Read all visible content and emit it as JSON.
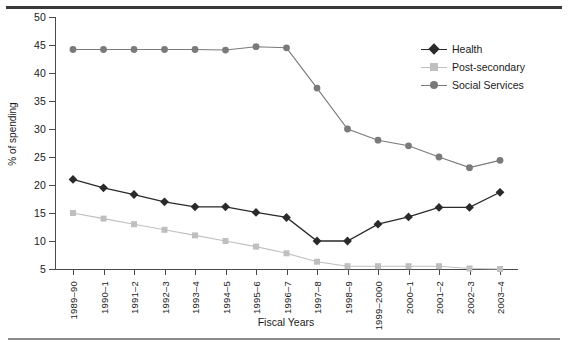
{
  "chart_data": {
    "type": "line",
    "title": "",
    "xlabel": "Fiscal Years",
    "ylabel": "% of spending",
    "ylim": [
      5,
      50
    ],
    "yticks": [
      5,
      10,
      15,
      20,
      25,
      30,
      35,
      40,
      45,
      50
    ],
    "grid": false,
    "legend_position": "upper-right",
    "categories": [
      "1989–90",
      "1990–1",
      "1991–2",
      "1992–3",
      "1993–4",
      "1994–5",
      "1995–6",
      "1996–7",
      "1997–8",
      "1998–9",
      "1999–2000",
      "2000–1",
      "2001–2",
      "2002–3",
      "2003–4"
    ],
    "series": [
      {
        "name": "Health",
        "color": "#2a2a2a",
        "marker": "diamond",
        "values": [
          21.0,
          19.5,
          18.3,
          17.0,
          16.1,
          16.1,
          15.1,
          14.2,
          10.0,
          10.0,
          13.0,
          14.3,
          16.0,
          16.0,
          18.7
        ]
      },
      {
        "name": "Post-secondary",
        "color": "#bfbfbf",
        "marker": "square",
        "values": [
          15.0,
          14.0,
          13.0,
          12.0,
          11.0,
          10.0,
          9.0,
          7.8,
          6.3,
          5.5,
          5.5,
          5.5,
          5.5,
          5.1,
          5.0
        ]
      },
      {
        "name": "Social Services",
        "color": "#7a7a7a",
        "marker": "circle",
        "values": [
          44.2,
          44.2,
          44.2,
          44.2,
          44.2,
          44.1,
          44.7,
          44.5,
          37.3,
          30.0,
          28.0,
          27.0,
          25.0,
          23.1,
          24.4
        ]
      }
    ]
  },
  "colors": {
    "rule_top": "#3a3a3a",
    "rule_bottom": "#8a8a8a",
    "axis": "#4a4a4a",
    "text": "#1a1a1a"
  }
}
